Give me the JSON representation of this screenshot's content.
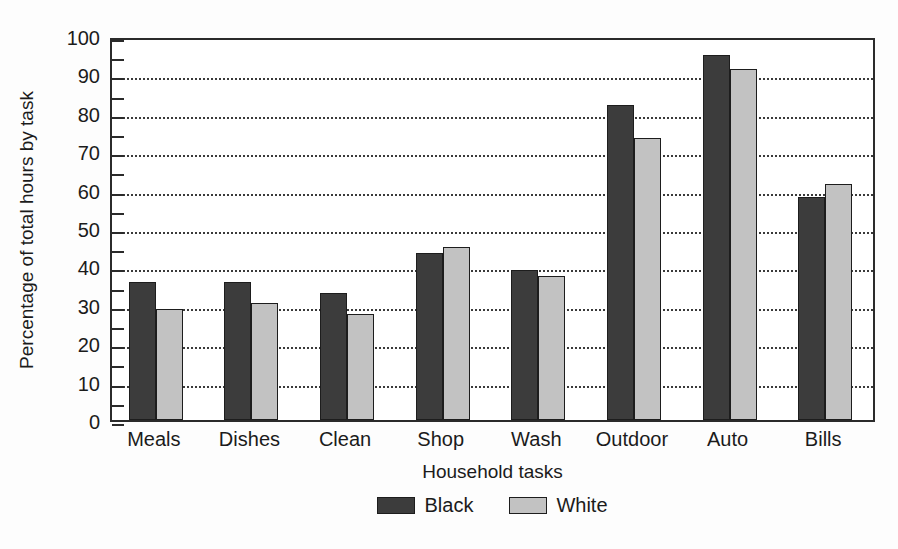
{
  "chart_data": {
    "type": "bar",
    "title": "",
    "xlabel": "Household tasks",
    "ylabel": "Percentage of total hours by task",
    "categories": [
      "Meals",
      "Dishes",
      "Clean",
      "Shop",
      "Wash",
      "Outdoor",
      "Auto",
      "Bills"
    ],
    "series": [
      {
        "name": "Black",
        "color": "#3c3c3c",
        "values": [
          36,
          36,
          33,
          43.5,
          39,
          82,
          95,
          58
        ]
      },
      {
        "name": "White",
        "color": "#c2c2c2",
        "values": [
          29,
          30.5,
          27.5,
          45,
          37.5,
          73.5,
          91.5,
          61.5
        ]
      }
    ],
    "ylim": [
      0,
      100
    ],
    "ytick_values": [
      0,
      10,
      20,
      30,
      40,
      50,
      60,
      70,
      80,
      90,
      100
    ],
    "ytick_labels": [
      "0",
      "10",
      "20",
      "30",
      "40",
      "50",
      "60",
      "70",
      "80",
      "90",
      "100"
    ],
    "yminor_tick_step": 5,
    "grid": "horizontal-dotted",
    "grid_at": [
      10,
      20,
      30,
      40,
      50,
      60,
      70,
      80,
      90
    ],
    "legend_position": "bottom-center",
    "axis_color": "#2b2b2b",
    "background_color": "#ffffff"
  }
}
